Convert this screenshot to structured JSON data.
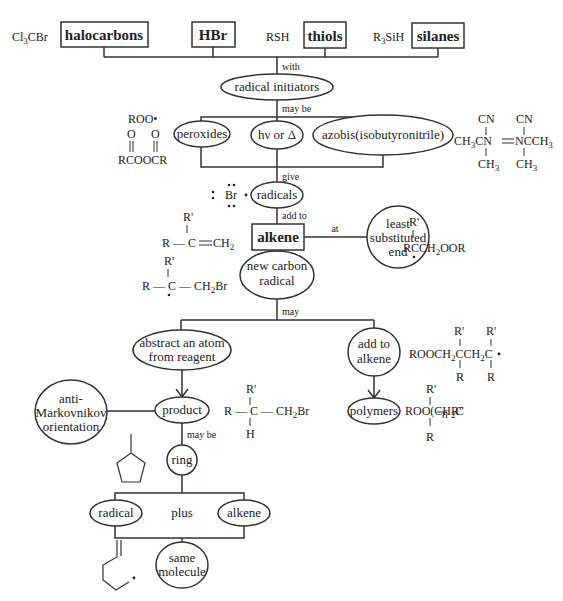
{
  "reagents": [
    {
      "formula": "Cl3CBr",
      "label": "halocarbons"
    },
    {
      "formula": "",
      "label": "HBr"
    },
    {
      "formula": "RSH",
      "label": "thiols"
    },
    {
      "formula": "R3SiH",
      "label": "silanes"
    }
  ],
  "edges": {
    "with": "with",
    "may_be": "may be",
    "give": "give",
    "add_to": "add to",
    "at": "at",
    "may": "may",
    "may_be_ring": "may be",
    "plus": "plus"
  },
  "nodes": {
    "radical_initiators": "radical initiators",
    "peroxides": "peroxides",
    "hv_or_delta": "hν or Δ",
    "azobis": "azobis(isobutyronitrile)",
    "radicals": "radicals",
    "alkene_box": "alkene",
    "least_substituted": [
      "least",
      "substituted",
      "end"
    ],
    "new_carbon_radical": [
      "new carbon",
      "radical"
    ],
    "abstract": [
      "abstract an atom",
      "from reagent"
    ],
    "add_to_alkene": [
      "add to",
      "alkene"
    ],
    "product": "product",
    "polymers": "polymers",
    "anti_markovnikov": [
      "anti-",
      "Markovnikov",
      "orientation"
    ],
    "ring": "ring",
    "radical": "radical",
    "alkene": "alkene",
    "same_molecule": [
      "same",
      "molecule"
    ]
  },
  "structures": {
    "peroxy_radical": "ROO•",
    "diacyl_peroxide": "RCOOCR",
    "aibn_left": "CH3CN",
    "aibn_right": "NCCH3",
    "br_radical": "Br",
    "alkene_struct": "R — C ═ CH2",
    "br_radical_adduct": "R — C — CH2Br",
    "peroxy_adduct": "RCCH2OOR",
    "product_struct": "R — C — CH2Br",
    "dimer_radical": "ROOCH2CCH2C•",
    "polymer_struct": "ROO(CH2C)n R\""
  }
}
